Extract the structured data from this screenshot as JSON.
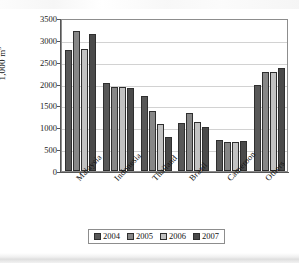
{
  "chart_data": {
    "type": "bar",
    "title": "",
    "subtitle": "",
    "xlabel": "",
    "ylabel": "1,000 m",
    "ylabel_exponent": "3",
    "ylim": [
      0,
      3500
    ],
    "ytick_step": 500,
    "yticks": [
      "3500",
      "3000",
      "2500",
      "2000",
      "1500",
      "1000",
      "500",
      "0"
    ],
    "ytick_values": [
      3500,
      3000,
      2500,
      2000,
      1500,
      1000,
      500,
      0
    ],
    "grid": "horizontal",
    "legend_position": "bottom",
    "orientation": "vertical",
    "grouping": "clustered",
    "categories": [
      "Malaysia",
      "Indonesia",
      "Thailand",
      "Brazil",
      "Cameroon",
      "Others"
    ],
    "series": [
      {
        "name": "2004",
        "color": "#585858",
        "values": [
          2770,
          2010,
          1710,
          1100,
          700,
          1970
        ]
      },
      {
        "name": "2005",
        "color": "#878787",
        "values": [
          3200,
          1930,
          1370,
          1330,
          675,
          2270
        ]
      },
      {
        "name": "2006",
        "color": "#c2c2c2",
        "values": [
          2800,
          1920,
          1080,
          1110,
          670,
          2270
        ]
      },
      {
        "name": "2007",
        "color": "#4a4a4a",
        "values": [
          3145,
          1890,
          775,
          1010,
          680,
          2360
        ]
      }
    ]
  },
  "legend": {
    "items": [
      {
        "label": "2004",
        "color": "#585858"
      },
      {
        "label": "2005",
        "color": "#878787"
      },
      {
        "label": "2006",
        "color": "#c2c2c2"
      },
      {
        "label": "2007",
        "color": "#4a4a4a"
      }
    ]
  }
}
